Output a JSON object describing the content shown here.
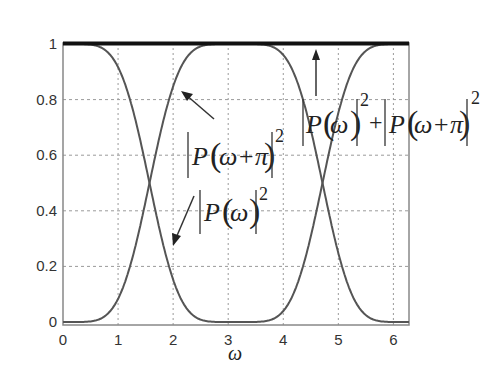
{
  "chart_data": {
    "type": "line",
    "title": "",
    "xlabel": "ω",
    "ylabel": "",
    "xlim": [
      0,
      6.2832
    ],
    "ylim": [
      0,
      1
    ],
    "grid": true,
    "x_ticks": [
      "0",
      "1",
      "2",
      "3",
      "4",
      "5",
      "6"
    ],
    "y_ticks": [
      "0",
      "0.2",
      "0.4",
      "0.6",
      "0.8",
      "1"
    ],
    "x": [
      0,
      0.5,
      1.0,
      1.25,
      1.5708,
      2.0,
      2.5,
      3.1416,
      3.78,
      4.28,
      4.7124,
      5.03,
      5.28,
      5.78,
      6.2832
    ],
    "series": [
      {
        "name": "|P(ω)|²",
        "values": [
          1.0,
          0.999,
          0.915,
          0.777,
          0.5,
          0.153,
          0.008,
          0.0,
          0.008,
          0.153,
          0.5,
          0.777,
          0.915,
          0.999,
          1.0
        ]
      },
      {
        "name": "|P(ω+π)|²",
        "values": [
          0.0,
          0.001,
          0.085,
          0.223,
          0.5,
          0.847,
          0.992,
          1.0,
          0.992,
          0.847,
          0.5,
          0.223,
          0.085,
          0.001,
          0.0
        ]
      },
      {
        "name": "|P(ω)|² + |P(ω+π)|²",
        "values": [
          1,
          1,
          1,
          1,
          1,
          1,
          1,
          1,
          1,
          1,
          1,
          1,
          1,
          1,
          1
        ]
      }
    ],
    "annotations": [
      {
        "text": "|P(ω+π)|²",
        "arrow_to": [
          2.0,
          0.82
        ]
      },
      {
        "text": "|P(ω)|²",
        "arrow_to": [
          2.0,
          0.18
        ]
      },
      {
        "text": "|P(ω)|² + |P(ω+π)|²",
        "arrow_to": [
          4.6,
          1.0
        ]
      }
    ]
  },
  "labels": {
    "x_axis": "ω",
    "ann_shift": {
      "P": "P",
      "arg": "ω+π",
      "exp": "2"
    },
    "ann_plain": {
      "P": "P",
      "arg": "ω",
      "exp": "2"
    },
    "ann_sum": {
      "P1": "P",
      "arg1": "ω",
      "exp1": "2",
      "plus": "+",
      "P2": "P",
      "arg2": "ω+π",
      "exp2": "2"
    }
  },
  "colors": {
    "curve": "#555555",
    "sum": "#111111",
    "grid": "#9a9a9a",
    "axis": "#777777"
  }
}
